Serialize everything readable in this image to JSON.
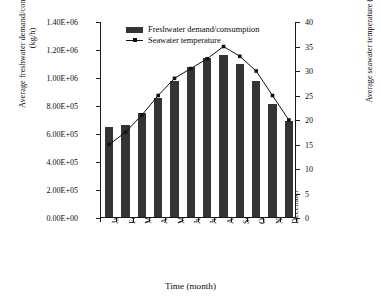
{
  "chart_data": {
    "type": "bar",
    "title": "",
    "xlabel": "Time (month)",
    "ylabel": "Average freshwater demand/consumption (kg/h)",
    "ylabel_line1": "Average freshwater demand/consumption",
    "ylabel_line2": "(kg/h)",
    "y2label": "Average seawater temperature (°C)",
    "categories": [
      "January",
      "February",
      "March",
      "April",
      "May",
      "June",
      "July",
      "August",
      "September",
      "October",
      "November",
      "December"
    ],
    "ylim": [
      0,
      1400000
    ],
    "y2lim": [
      0,
      40
    ],
    "yticks": [
      0,
      200000,
      400000,
      600000,
      800000,
      1000000,
      1200000,
      1400000
    ],
    "ytick_labels": [
      "0.00E+00",
      "2.00E+05",
      "4.00E+05",
      "6.00E+05",
      "8.00E+05",
      "1.00E+06",
      "1.20E+06",
      "1.40E+06"
    ],
    "y2ticks": [
      0,
      5,
      10,
      15,
      20,
      25,
      30,
      35,
      40
    ],
    "y2tick_labels": [
      "0",
      "5",
      "10",
      "15",
      "20",
      "25",
      "30",
      "35",
      "40"
    ],
    "grid": false,
    "legend_position": "top-left-inside",
    "series": [
      {
        "name": "Freshwater demand/consumption",
        "type": "bar",
        "axis": "left",
        "unit": "kg/h",
        "color": "#343434",
        "values": [
          640000,
          660000,
          745000,
          850000,
          975000,
          1070000,
          1135000,
          1155000,
          1090000,
          975000,
          810000,
          685000
        ]
      },
      {
        "name": "Seawater temperature",
        "type": "line",
        "axis": "right",
        "unit": "°C",
        "color": "#111111",
        "marker": "square",
        "values": [
          15.0,
          17.5,
          21.0,
          25.0,
          28.5,
          30.5,
          32.5,
          35.0,
          33.0,
          30.0,
          25.0,
          20.0
        ]
      }
    ]
  },
  "legend": {
    "items": [
      {
        "label": "Freshwater demand/consumption",
        "marker": "bar-swatch"
      },
      {
        "label": "Seawater temperature",
        "marker": "line-marker-swatch"
      }
    ]
  }
}
